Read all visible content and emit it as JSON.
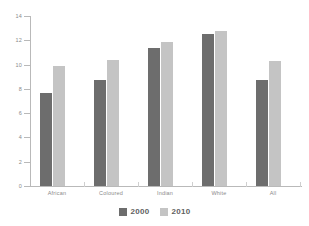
{
  "chart_data": {
    "type": "bar",
    "title": "",
    "subtitle": "",
    "xlabel": "",
    "ylabel": "",
    "categories": [
      "African",
      "Coloured",
      "Indian",
      "White",
      "All"
    ],
    "series": [
      {
        "name": "2000",
        "color": "#6d6d6d",
        "values": [
          7.7,
          8.7,
          11.4,
          12.5,
          8.7
        ]
      },
      {
        "name": "2010",
        "color": "#c4c4c4",
        "values": [
          9.9,
          10.4,
          11.9,
          12.8,
          10.3
        ]
      }
    ],
    "ylim": [
      0,
      14
    ],
    "yticks": [
      0,
      2,
      4,
      6,
      8,
      10,
      12,
      14
    ],
    "ytick_labels": [
      "0",
      "2",
      "4",
      "6",
      "8",
      "10",
      "12",
      "14"
    ],
    "grid": false,
    "legend_position": "bottom",
    "annotations": []
  },
  "legend": {
    "entries": [
      {
        "label": "2000",
        "color": "#6d6d6d"
      },
      {
        "label": "2010",
        "color": "#c4c4c4"
      }
    ]
  },
  "colors": {
    "axis": "#b9b9b9",
    "tick_text": "#8a8a8a",
    "legend_text": "#5f5f5f",
    "background": "#ffffff"
  }
}
